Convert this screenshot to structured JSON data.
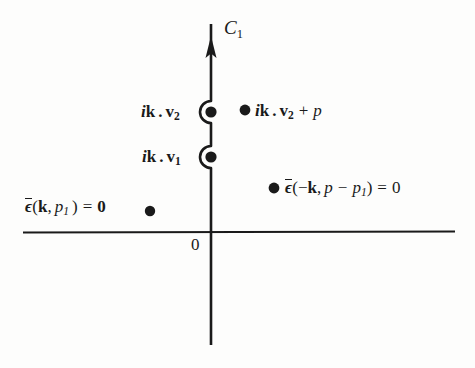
{
  "figure": {
    "background_color": "#fdfdfc",
    "ink_color": "#1a1a1a"
  },
  "axes": {
    "origin_label": "0",
    "vertical_axis": {
      "name": "contour-line",
      "x": 211,
      "y_top": 20,
      "y_bottom": 345,
      "arrow_direction": "up",
      "arrow_tip_y": 38
    },
    "horizontal_axis": {
      "name": "real-axis",
      "y": 232,
      "x_left": 23,
      "x_right": 455
    }
  },
  "contour": {
    "label": "C",
    "label_sub": "1",
    "detour_radius": 11,
    "detour_side": "right",
    "detours": [
      {
        "name": "detour-around-pole-ikv2",
        "y": 112
      },
      {
        "name": "detour-around-pole-ikv1",
        "y": 157
      }
    ]
  },
  "poles": [
    {
      "id": "pole-ikv2",
      "x": 211,
      "y": 112,
      "on_contour": true,
      "label": {
        "prefix_i": "i",
        "vec_k": "k",
        "dot": ".",
        "vec_v": "v",
        "sub": "2",
        "text": "ik . v2"
      }
    },
    {
      "id": "pole-ikv1",
      "x": 211,
      "y": 157,
      "on_contour": true,
      "label": {
        "prefix_i": "i",
        "vec_k": "k",
        "dot": ".",
        "vec_v": "v",
        "sub": "1",
        "text": "ik . v1"
      }
    },
    {
      "id": "pole-ikv2-plus-p",
      "x": 245,
      "y": 110,
      "on_contour": false,
      "label": {
        "prefix_i": "i",
        "vec_k": "k",
        "dot": ".",
        "vec_v": "v",
        "sub": "2",
        "plus": "+",
        "p": "p",
        "text": "ik . v2 + p"
      }
    },
    {
      "id": "pole-eps-neg-k",
      "x": 274,
      "y": 188,
      "on_contour": false,
      "label": {
        "eps": "ϵ",
        "open": "(−",
        "vec_k": "k",
        "comma": ",",
        "p": "p",
        "minus": "−",
        "p_sub": "p",
        "sub": "1",
        "close": ")",
        "equals": "=",
        "zero": "0",
        "text": "ϵ̄(−k, p − p1) = 0"
      }
    },
    {
      "id": "pole-eps-pos-k",
      "x": 150,
      "y": 211,
      "on_contour": false,
      "label": {
        "eps": "ϵ",
        "open": "(",
        "vec_k": "k",
        "comma": ",",
        "p_sub": "p",
        "sub": "1",
        "close": ")",
        "equals": "=",
        "zero": "0",
        "text": "ϵ̄(k, p1) = 0"
      }
    }
  ],
  "markers": {
    "dot_radius": 5.5,
    "dot_color": "#1a1a1a"
  }
}
